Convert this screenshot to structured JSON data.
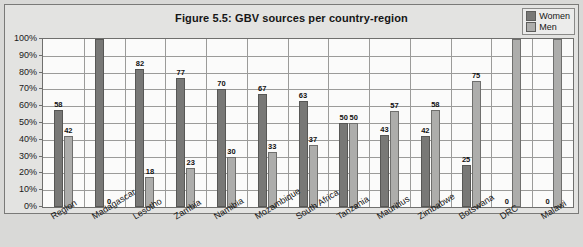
{
  "figure": {
    "title": "Figure 5.5: GBV sources per country-region"
  },
  "legend": {
    "position": "top-right",
    "entries": [
      {
        "label": "Women",
        "color": "#787876",
        "icon": "legend-swatch-women"
      },
      {
        "label": "Men",
        "color": "#adadab",
        "icon": "legend-swatch-men"
      }
    ]
  },
  "axis": {
    "y_ticks": [
      "100%",
      "90%",
      "80%",
      "70%",
      "60%",
      "50%",
      "40%",
      "30%",
      "20%",
      "10%",
      "0%"
    ]
  },
  "chart_data": {
    "type": "bar",
    "title": "Figure 5.5: GBV sources per country-region",
    "xlabel": "",
    "ylabel": "",
    "ylim": [
      0,
      100
    ],
    "ytick_values": [
      0,
      10,
      20,
      30,
      40,
      50,
      60,
      70,
      80,
      90,
      100
    ],
    "ytick_labels": [
      "0%",
      "10%",
      "20%",
      "30%",
      "40%",
      "50%",
      "60%",
      "70%",
      "80%",
      "90%",
      "100%"
    ],
    "grid": true,
    "legend_position": "top-right",
    "categories": [
      "Region",
      "Madagascar",
      "Lesotho",
      "Zambia",
      "Namibia",
      "Mozambique",
      "South Africa",
      "Tanzania",
      "Mauritius",
      "Zimbabwe",
      "Botswana",
      "DRC",
      "Malawi"
    ],
    "series": [
      {
        "name": "Women",
        "color": "#787876",
        "values": [
          58,
          100,
          82,
          77,
          70,
          67,
          63,
          50,
          43,
          42,
          25,
          0,
          0
        ],
        "labels": [
          "58",
          "",
          "82",
          "77",
          "70",
          "67",
          "63",
          "50",
          "43",
          "42",
          "25",
          "0",
          "0"
        ]
      },
      {
        "name": "Men",
        "color": "#adadab",
        "values": [
          42,
          0,
          18,
          23,
          30,
          33,
          37,
          50,
          57,
          58,
          75,
          100,
          100
        ],
        "labels": [
          "42",
          "0",
          "18",
          "23",
          "30",
          "33",
          "37",
          "50",
          "57",
          "58",
          "75",
          "",
          ""
        ]
      }
    ]
  }
}
